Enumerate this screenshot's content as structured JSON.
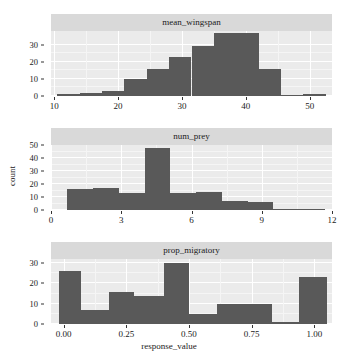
{
  "figure": {
    "xlabel": "response_value",
    "ylabel": "count"
  },
  "chart_data": [
    {
      "type": "bar",
      "title": "mean_wingspan",
      "xlabel": "response_value",
      "ylabel": "count",
      "xlim": [
        9.5,
        53.5
      ],
      "ylim": [
        0,
        38
      ],
      "yticks": [
        0,
        10,
        20,
        30
      ],
      "xticks": [
        10,
        20,
        30,
        40,
        50
      ],
      "grid": true,
      "bin_edges": [
        10.5,
        14.0,
        17.5,
        21.0,
        24.5,
        28.0,
        31.5,
        35.0,
        38.5,
        42.0,
        45.5,
        49.0,
        52.5
      ],
      "values": [
        1,
        2,
        3,
        10,
        16,
        23,
        29,
        37,
        37,
        16,
        0,
        1
      ],
      "bar_color": "#595959"
    },
    {
      "type": "bar",
      "title": "num_prey",
      "xlabel": "response_value",
      "ylabel": "count",
      "xlim": [
        0,
        12
      ],
      "ylim": [
        0,
        50
      ],
      "yticks": [
        0,
        10,
        20,
        30,
        40,
        50
      ],
      "xticks": [
        0,
        3,
        6,
        9,
        12
      ],
      "grid": true,
      "bin_edges": [
        0.7,
        1.8,
        2.9,
        4.0,
        5.1,
        6.2,
        7.3,
        8.4,
        9.5,
        10.6,
        11.7
      ],
      "values": [
        16,
        17,
        13,
        48,
        13,
        14,
        7,
        6,
        0,
        1
      ],
      "bar_color": "#595959"
    },
    {
      "type": "bar",
      "title": "prop_migratory",
      "xlabel": "response_value",
      "ylabel": "count",
      "xlim": [
        -0.05,
        1.07
      ],
      "ylim": [
        0,
        32
      ],
      "yticks": [
        0,
        10,
        20,
        30
      ],
      "xticks": [
        0.0,
        0.25,
        0.5,
        0.75,
        1.0
      ],
      "xticklabels": [
        "0.00",
        "0.25",
        "0.50",
        "0.75",
        "1.00"
      ],
      "grid": true,
      "bin_edges": [
        -0.02,
        0.07,
        0.18,
        0.28,
        0.4,
        0.5,
        0.61,
        0.72,
        0.83,
        0.94,
        1.05
      ],
      "values": [
        26,
        7,
        16,
        14,
        30,
        5,
        10,
        10,
        1,
        23
      ],
      "bar_color": "#595959"
    }
  ]
}
